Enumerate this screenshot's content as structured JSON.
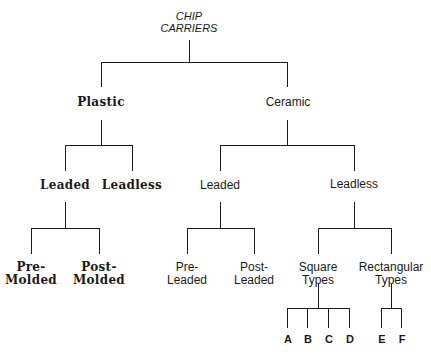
{
  "diagram": {
    "root": {
      "line1": "CHIP",
      "line2": "CARRIERS"
    },
    "plastic": {
      "label": "Plastic",
      "leaded": {
        "label": "Leaded",
        "pre_molded": {
          "line1": "Pre-",
          "line2": "Molded"
        },
        "post_molded": {
          "line1": "Post-",
          "line2": "Molded"
        }
      },
      "leadless": {
        "label": "Leadless"
      }
    },
    "ceramic": {
      "label": "Ceramic",
      "leaded": {
        "label": "Leaded",
        "pre_leaded": {
          "line1": "Pre-",
          "line2": "Leaded"
        },
        "post_leaded": {
          "line1": "Post-",
          "line2": "Leaded"
        }
      },
      "leadless": {
        "label": "Leadless",
        "square_types": {
          "line1": "Square",
          "line2": "Types",
          "children": [
            "A",
            "B",
            "C",
            "D"
          ]
        },
        "rectangular_types": {
          "line1": "Rectangular",
          "line2": "Types",
          "children": [
            "E",
            "F"
          ]
        }
      }
    }
  }
}
